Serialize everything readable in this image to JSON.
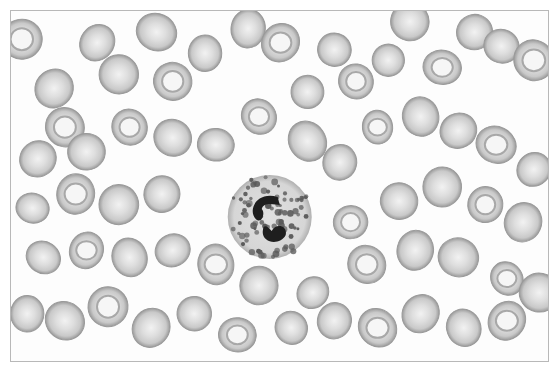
{
  "image": {
    "subject": "Peripheral blood smear micrograph",
    "description": "Grayscale micrograph showing numerous red blood cells surrounding a single granulated white blood cell with a segmented dark nucleus",
    "palette": {
      "background": "#fdfdfd",
      "rbc_fill": "#c9c9c9",
      "rbc_edge": "#9a9a9a",
      "rbc_pallor": "#f2f2f2",
      "wbc_cytoplasm": "#d6d6d6",
      "wbc_granule": "#5a5a5a",
      "wbc_nucleus": "#1e1e1e"
    },
    "white_cell": {
      "type": "granulocyte",
      "cx": 0.48,
      "cy": 0.585
    },
    "red_cells": [
      [
        0.02,
        0.08
      ],
      [
        0.08,
        0.22
      ],
      [
        0.16,
        0.09
      ],
      [
        0.1,
        0.33
      ],
      [
        0.2,
        0.18
      ],
      [
        0.27,
        0.06
      ],
      [
        0.3,
        0.2
      ],
      [
        0.36,
        0.12
      ],
      [
        0.44,
        0.05
      ],
      [
        0.5,
        0.09
      ],
      [
        0.55,
        0.23
      ],
      [
        0.6,
        0.11
      ],
      [
        0.64,
        0.2
      ],
      [
        0.7,
        0.14
      ],
      [
        0.74,
        0.03
      ],
      [
        0.8,
        0.16
      ],
      [
        0.86,
        0.06
      ],
      [
        0.91,
        0.1
      ],
      [
        0.97,
        0.14
      ],
      [
        0.05,
        0.42
      ],
      [
        0.14,
        0.4
      ],
      [
        0.22,
        0.33
      ],
      [
        0.3,
        0.36
      ],
      [
        0.38,
        0.38
      ],
      [
        0.46,
        0.3
      ],
      [
        0.55,
        0.37
      ],
      [
        0.61,
        0.43
      ],
      [
        0.68,
        0.33
      ],
      [
        0.76,
        0.3
      ],
      [
        0.83,
        0.34
      ],
      [
        0.9,
        0.38
      ],
      [
        0.97,
        0.45
      ],
      [
        0.04,
        0.56
      ],
      [
        0.12,
        0.52
      ],
      [
        0.2,
        0.55
      ],
      [
        0.28,
        0.52
      ],
      [
        0.63,
        0.6
      ],
      [
        0.72,
        0.54
      ],
      [
        0.8,
        0.5
      ],
      [
        0.88,
        0.55
      ],
      [
        0.95,
        0.6
      ],
      [
        0.06,
        0.7
      ],
      [
        0.14,
        0.68
      ],
      [
        0.22,
        0.7
      ],
      [
        0.3,
        0.68
      ],
      [
        0.38,
        0.72
      ],
      [
        0.46,
        0.78
      ],
      [
        0.56,
        0.8
      ],
      [
        0.66,
        0.72
      ],
      [
        0.75,
        0.68
      ],
      [
        0.83,
        0.7
      ],
      [
        0.92,
        0.76
      ],
      [
        0.03,
        0.86
      ],
      [
        0.1,
        0.88
      ],
      [
        0.18,
        0.84
      ],
      [
        0.26,
        0.9
      ],
      [
        0.34,
        0.86
      ],
      [
        0.42,
        0.92
      ],
      [
        0.52,
        0.9
      ],
      [
        0.6,
        0.88
      ],
      [
        0.68,
        0.9
      ],
      [
        0.76,
        0.86
      ],
      [
        0.84,
        0.9
      ],
      [
        0.92,
        0.88
      ],
      [
        0.98,
        0.8
      ]
    ]
  }
}
